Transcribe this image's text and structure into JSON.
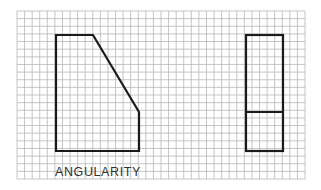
{
  "diagram": {
    "caption": "ANGULARITY",
    "grid": {
      "x0": 17,
      "y0": 11,
      "x1": 305,
      "y1": 179,
      "cols": 38,
      "rows": 22,
      "line_color": "#b8b8b8"
    },
    "stroke_color": "#1a1a1a",
    "front_view": {
      "points": "56,35 93,35 139,112 139,151 56,151"
    },
    "side_view": {
      "x": 246,
      "y": 35,
      "width": 37,
      "height": 116,
      "divider_y": 112
    }
  }
}
